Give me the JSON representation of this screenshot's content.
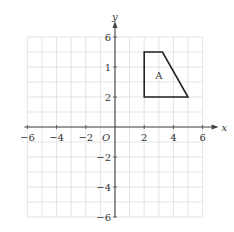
{
  "diagram": {
    "type": "coordinate-grid",
    "x_axis": {
      "label": "x",
      "min": -6,
      "max": 6,
      "tick_labels": [
        "-6",
        "-4",
        "-2",
        "2",
        "4",
        "6"
      ],
      "tick_values": [
        -6,
        -4,
        -2,
        2,
        4,
        6
      ]
    },
    "y_axis": {
      "label": "y",
      "min": -6,
      "max": 6,
      "tick_labels": [
        "6",
        "1",
        "2",
        "-2",
        "-4",
        "-6"
      ],
      "tick_values": [
        6,
        4,
        2,
        -2,
        -4,
        -6
      ]
    },
    "origin_label": "O",
    "grid_step": 1,
    "shape": {
      "label": "A",
      "vertices": [
        [
          2,
          5
        ],
        [
          3.25,
          5
        ],
        [
          5,
          2
        ],
        [
          2,
          2
        ]
      ],
      "label_position": [
        3,
        3.5
      ]
    },
    "colors": {
      "grid": "#dcdcdc",
      "axis": "#444444",
      "shape": "#222222",
      "text": "#333333"
    }
  }
}
